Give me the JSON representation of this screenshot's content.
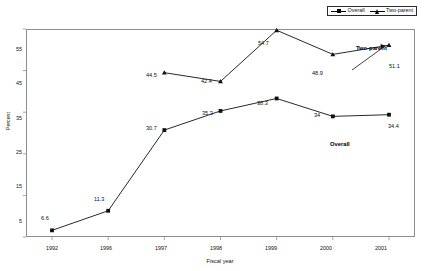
{
  "figure": {
    "title_fragment": "",
    "xlabel": "Fiscal year",
    "ylabel": "Percent"
  },
  "legend": {
    "position": "top-right",
    "items": [
      {
        "label": "Overall",
        "marker": "square-marker"
      },
      {
        "label": "Two-parent",
        "marker": "triangle-marker"
      }
    ]
  },
  "annotations": [
    {
      "text": "Two-parent",
      "series": "Two-parent"
    },
    {
      "text": "Overall",
      "series": "Overall"
    }
  ],
  "axis": {
    "yticks": [
      "55",
      "45",
      "35",
      "25",
      "15",
      "5"
    ],
    "xticks": [
      "1992",
      "1996",
      "1997",
      "1998",
      "1999",
      "2000",
      "2001"
    ]
  },
  "chart_data": {
    "type": "line",
    "title": "",
    "xlabel": "Fiscal year",
    "ylabel": "Percent",
    "categories": [
      "1992",
      "1996",
      "1997",
      "1998",
      "1999",
      "2000",
      "2001"
    ],
    "ylim": [
      5,
      55
    ],
    "ytick_values": [
      5,
      15,
      25,
      35,
      45,
      55
    ],
    "grid": false,
    "legend_position": "top-right",
    "series": [
      {
        "name": "Overall",
        "marker": "square",
        "values": [
          6.6,
          11.3,
          30.7,
          35.3,
          38.3,
          34,
          34.4
        ],
        "labels": [
          "6.6",
          "11.3",
          "30.7",
          "35.3",
          "38.3",
          "34",
          "34.4"
        ]
      },
      {
        "name": "Two-parent",
        "marker": "triangle",
        "values": [
          null,
          null,
          44.5,
          42.4,
          54.7,
          48.9,
          51.1
        ],
        "labels": [
          "",
          "",
          "44.5",
          "42.4",
          "54.7",
          "48.9",
          "51.1"
        ]
      }
    ]
  }
}
